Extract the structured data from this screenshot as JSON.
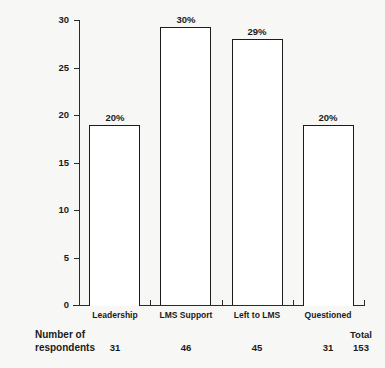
{
  "chart_data": {
    "type": "bar",
    "title": "",
    "subtitle": "",
    "xlabel": "",
    "ylabel": "",
    "categories": [
      "Leadership",
      "LMS Support",
      "Left to LMS",
      "Questioned"
    ],
    "values": [
      19,
      29.3,
      28,
      19
    ],
    "data_labels": [
      "20%",
      "30%",
      "29%",
      "20%"
    ],
    "ylim": [
      0,
      30
    ],
    "yticks": [
      0,
      5,
      10,
      15,
      20,
      25,
      30
    ],
    "ytick_labels": [
      "0",
      "5",
      "10",
      "15",
      "20",
      "25",
      "30"
    ],
    "grid": false,
    "legend": false,
    "bar_fill": "#ffffff",
    "bar_edge": "#1b1b1b",
    "annotations": {
      "row_label": "Number of\nrespondents",
      "row_values": [
        "31",
        "46",
        "45",
        "31"
      ],
      "total_label": "Total",
      "total_value": "153"
    }
  },
  "colors": {
    "background": "#f7f7f5",
    "axis": "#2b2b2b",
    "text": "#1b1b1b"
  }
}
